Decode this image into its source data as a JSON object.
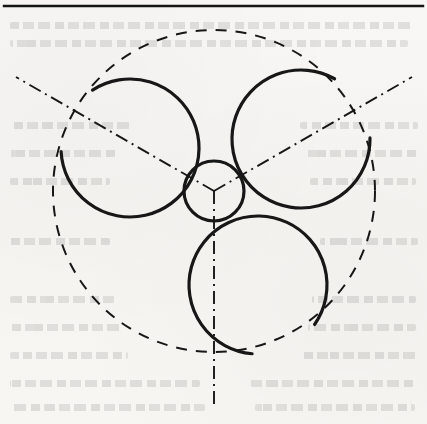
{
  "page": {
    "width": 427,
    "height": 424,
    "background_color": "#f7f6f4",
    "ink_color": "#1a1a1a",
    "caption": "",
    "ghost_text_visible": "true",
    "scan_note": ""
  },
  "figure": {
    "title": "Three-lobe rotor profile with pitch circle and 120-degree axes",
    "kind": "engineering-line-drawing",
    "line_color": "#171717",
    "solid_line_width": 3.2,
    "dashed_line_width": 2.0,
    "dashdot_line_width": 1.9
  },
  "top_rule": {
    "name": "horizontal-rule",
    "y": 6,
    "x_start": 4,
    "x_end": 423,
    "thickness": 2.4,
    "color": "#151515"
  },
  "center": {
    "x": 214,
    "y": 191,
    "label": "rotor-center"
  },
  "hub_circle": {
    "name": "hub-circle",
    "cx": 214,
    "cy": 191,
    "r": 30,
    "style": "solid",
    "stroke_width": 3.2
  },
  "pitch_circle": {
    "name": "pitch-circle",
    "cx": 214,
    "cy": 191,
    "r": 161,
    "style": "dashed",
    "dash_pattern": "11 9",
    "stroke_width": 2.0
  },
  "lobes": [
    {
      "name": "lobe-upper-right",
      "cx": 301,
      "cy": 139,
      "r": 69,
      "angle_deg": 330,
      "style": "solid",
      "arc_sweep_deg": 300
    },
    {
      "name": "lobe-left",
      "cx": 130,
      "cy": 148,
      "r": 69,
      "angle_deg": 210,
      "style": "solid",
      "arc_sweep_deg": 300
    },
    {
      "name": "lobe-lower-right",
      "cx": 258,
      "cy": 285,
      "r": 69,
      "angle_deg": 90,
      "style": "solid",
      "arc_sweep_deg": 300
    }
  ],
  "axes": [
    {
      "name": "axis-vertical-down",
      "angle_deg": 90,
      "x1": 214,
      "y1": 191,
      "x2": 214,
      "y2": 406,
      "style": "dash-dot"
    },
    {
      "name": "axis-upper-left",
      "angle_deg": 210,
      "x1": 214,
      "y1": 191,
      "x2": 16,
      "y2": 77,
      "style": "dash-dot"
    },
    {
      "name": "axis-upper-right",
      "angle_deg": 330,
      "x1": 214,
      "y1": 191,
      "x2": 412,
      "y2": 77,
      "style": "dash-dot"
    }
  ],
  "ghost_lines": [
    {
      "x": 10,
      "y": 22,
      "width": 405
    },
    {
      "x": 10,
      "y": 40,
      "width": 398
    },
    {
      "x": 10,
      "y": 122,
      "width": 120
    },
    {
      "x": 10,
      "y": 150,
      "width": 108
    },
    {
      "x": 10,
      "y": 178,
      "width": 100
    },
    {
      "x": 300,
      "y": 122,
      "width": 118
    },
    {
      "x": 305,
      "y": 150,
      "width": 112
    },
    {
      "x": 310,
      "y": 178,
      "width": 106
    },
    {
      "x": 10,
      "y": 238,
      "width": 100
    },
    {
      "x": 320,
      "y": 238,
      "width": 98
    },
    {
      "x": 10,
      "y": 296,
      "width": 108
    },
    {
      "x": 312,
      "y": 296,
      "width": 104
    },
    {
      "x": 10,
      "y": 324,
      "width": 112
    },
    {
      "x": 308,
      "y": 324,
      "width": 108
    },
    {
      "x": 10,
      "y": 352,
      "width": 118
    },
    {
      "x": 300,
      "y": 352,
      "width": 116
    },
    {
      "x": 10,
      "y": 380,
      "width": 190
    },
    {
      "x": 250,
      "y": 380,
      "width": 166
    },
    {
      "x": 10,
      "y": 404,
      "width": 195
    },
    {
      "x": 255,
      "y": 404,
      "width": 160
    }
  ]
}
